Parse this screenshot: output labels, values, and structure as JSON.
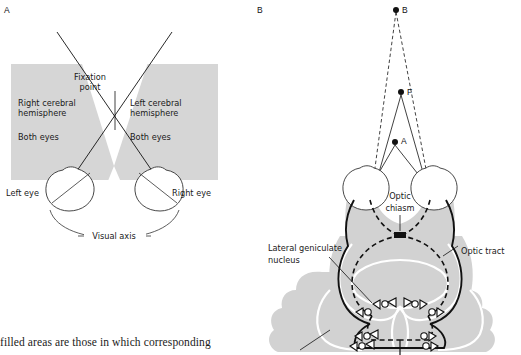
{
  "figure": {
    "type": "scientific-diagram",
    "caption": "filled areas are those in which corresponding",
    "colors": {
      "shaded_field": "#d6d6d6",
      "brain_tissue": "#d2d2d2",
      "outline": "#111111",
      "white": "#ffffff"
    }
  },
  "panel_a": {
    "letter": "A",
    "labels": {
      "fixation_point": "Fixation\npoint",
      "fixation_point_l1": "Fixation",
      "fixation_point_l2": "point",
      "right_hemisphere_l1": "Right cerebral",
      "right_hemisphere_l2": "hemisphere",
      "right_both_eyes": "Both eyes",
      "left_hemisphere_l1": "Left cerebral",
      "left_hemisphere_l2": "hemisphere",
      "left_both_eyes": "Both eyes",
      "left_eye": "Left eye",
      "right_eye": "Right eye",
      "visual_axis": "Visual axis"
    }
  },
  "panel_b": {
    "letter": "B",
    "points": [
      {
        "id": "B",
        "label": "B",
        "x": 401,
        "y": 10
      },
      {
        "id": "F",
        "label": "F",
        "x": 406,
        "y": 92
      },
      {
        "id": "A",
        "label": "A",
        "x": 400,
        "y": 141
      }
    ],
    "labels": {
      "optic_chiasm_l1": "Optic",
      "optic_chiasm_l2": "chiasm",
      "lateral_geniculate_l1": "Lateral geniculate",
      "lateral_geniculate_l2": "nucleus",
      "optic_tract": "Optic tract"
    }
  }
}
